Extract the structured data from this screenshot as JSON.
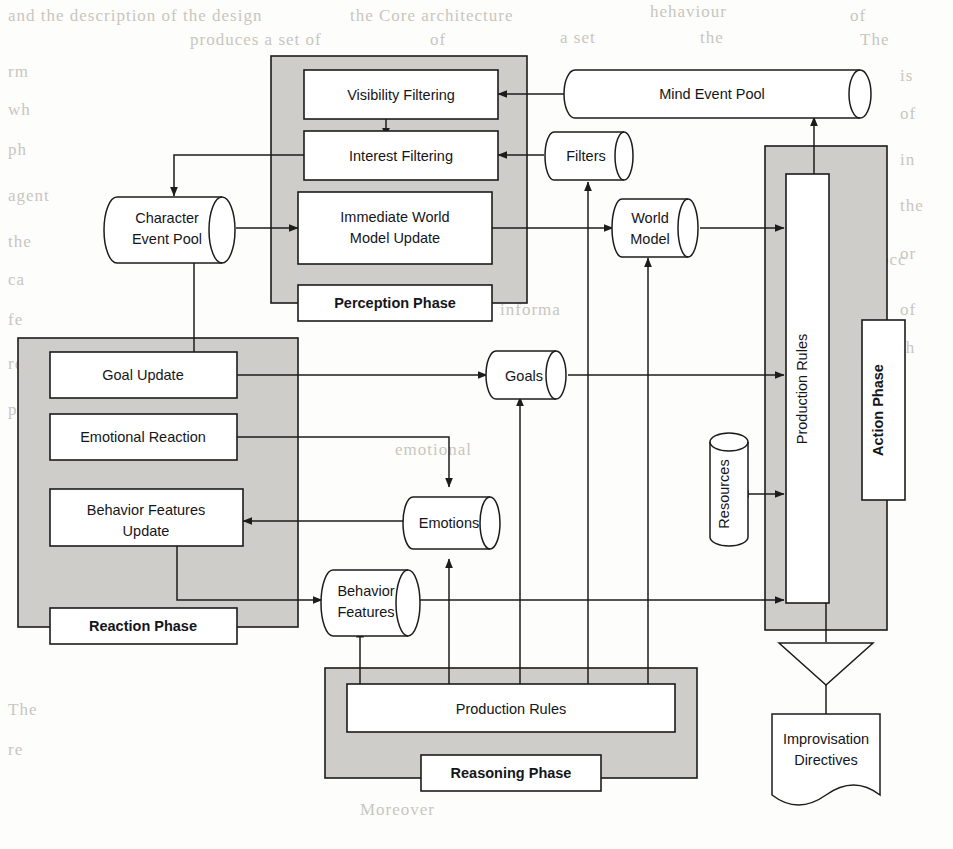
{
  "figure": {
    "background_text_color": "#c9c6bf",
    "panel_fill": "#cfcdc9",
    "box_fill": "#ffffff",
    "line_color": "#1c1c1c"
  },
  "phases": [
    {
      "id": "perception",
      "label": "Perception Phase"
    },
    {
      "id": "reaction",
      "label": "Reaction Phase"
    },
    {
      "id": "reasoning",
      "label": "Reasoning Phase"
    },
    {
      "id": "action",
      "label": "Action Phase"
    }
  ],
  "processes": [
    {
      "id": "visibility-filtering",
      "label": "Visibility Filtering",
      "phase": "perception"
    },
    {
      "id": "interest-filtering",
      "label": "Interest Filtering",
      "phase": "perception"
    },
    {
      "id": "immediate-world-model-update",
      "label_line1": "Immediate World",
      "label_line2": "Model Update",
      "phase": "perception"
    },
    {
      "id": "goal-update",
      "label": "Goal Update",
      "phase": "reaction"
    },
    {
      "id": "emotional-reaction",
      "label": "Emotional Reaction",
      "phase": "reaction"
    },
    {
      "id": "behavior-features-update",
      "label_line1": "Behavior Features",
      "label_line2": "Update",
      "phase": "reaction"
    },
    {
      "id": "production-rules-reasoning",
      "label": "Production Rules",
      "phase": "reasoning"
    },
    {
      "id": "production-rules-action",
      "label": "Production Rules",
      "phase": "action"
    }
  ],
  "stores": [
    {
      "id": "mind-event-pool",
      "label": "Mind Event Pool",
      "shape": "cylinder-horizontal"
    },
    {
      "id": "filters",
      "label": "Filters",
      "shape": "cylinder-horizontal"
    },
    {
      "id": "character-event-pool",
      "label_line1": "Character",
      "label_line2": "Event Pool",
      "shape": "cylinder-horizontal"
    },
    {
      "id": "world-model",
      "label_line1": "World",
      "label_line2": "Model",
      "shape": "cylinder-horizontal"
    },
    {
      "id": "goals",
      "label": "Goals",
      "shape": "cylinder-horizontal"
    },
    {
      "id": "emotions",
      "label": "Emotions",
      "shape": "cylinder-horizontal"
    },
    {
      "id": "behavior-features",
      "label_line1": "Behavior",
      "label_line2": "Features",
      "shape": "cylinder-horizontal"
    },
    {
      "id": "resources",
      "label": "Resources",
      "shape": "cylinder-vertical"
    }
  ],
  "outputs": [
    {
      "id": "improvisation-directives",
      "label_line1": "Improvisation",
      "label_line2": "Directives",
      "shape": "document"
    }
  ],
  "background_text": [
    {
      "text": "and the description of the design",
      "x": 8,
      "y": 6
    },
    {
      "text": "the Core architecture",
      "x": 350,
      "y": 6
    },
    {
      "text": "hehaviour",
      "x": 650,
      "y": 2
    },
    {
      "text": "of",
      "x": 850,
      "y": 6
    },
    {
      "text": "produces a set of",
      "x": 190,
      "y": 30
    },
    {
      "text": "of",
      "x": 430,
      "y": 30
    },
    {
      "text": "a set",
      "x": 560,
      "y": 28
    },
    {
      "text": "the",
      "x": 700,
      "y": 28
    },
    {
      "text": "The",
      "x": 860,
      "y": 30
    },
    {
      "text": "rm",
      "x": 8,
      "y": 62
    },
    {
      "text": "is",
      "x": 900,
      "y": 66
    },
    {
      "text": "wh",
      "x": 8,
      "y": 100
    },
    {
      "text": "of",
      "x": 900,
      "y": 104
    },
    {
      "text": "ph",
      "x": 8,
      "y": 140
    },
    {
      "text": "in",
      "x": 900,
      "y": 150
    },
    {
      "text": "agent",
      "x": 8,
      "y": 186
    },
    {
      "text": "the",
      "x": 900,
      "y": 196
    },
    {
      "text": "the",
      "x": 8,
      "y": 232
    },
    {
      "text": "or",
      "x": 900,
      "y": 244
    },
    {
      "text": "ca",
      "x": 8,
      "y": 270
    },
    {
      "text": "fe",
      "x": 8,
      "y": 310
    },
    {
      "text": "of",
      "x": 900,
      "y": 300
    },
    {
      "text": "th",
      "x": 900,
      "y": 338
    },
    {
      "text": "re",
      "x": 8,
      "y": 354
    },
    {
      "text": "occ",
      "x": 880,
      "y": 250
    },
    {
      "text": "informa",
      "x": 500,
      "y": 300
    },
    {
      "text": "anim",
      "x": 330,
      "y": 272
    },
    {
      "text": "pr",
      "x": 8,
      "y": 400
    },
    {
      "text": "emotional",
      "x": 395,
      "y": 440
    },
    {
      "text": "Moreover",
      "x": 360,
      "y": 800
    },
    {
      "text": "The",
      "x": 8,
      "y": 700
    },
    {
      "text": "re",
      "x": 8,
      "y": 740
    }
  ]
}
